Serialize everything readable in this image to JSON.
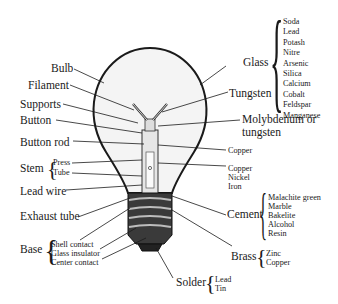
{
  "diagram": {
    "left_labels": {
      "bulb": "Bulb",
      "filament": "Filament",
      "supports": "Supports",
      "button": "Button",
      "button_rod": "Button rod",
      "stem": {
        "label": "Stem",
        "parts": [
          "Press",
          "Tube"
        ]
      },
      "lead_wire": "Lead wire",
      "exhaust_tube": "Exhaust tube",
      "base": {
        "label": "Base",
        "parts": [
          "Shell contact",
          "Glass insulator",
          "Center contact"
        ]
      }
    },
    "right_labels": {
      "glass": {
        "label": "Glass",
        "materials": [
          "Soda",
          "Lead",
          "Potash",
          "Nitre",
          "Arsenic",
          "Silica",
          "Calcium",
          "Cobalt",
          "Feldspar",
          "Manganese"
        ]
      },
      "tungsten": "Tungsten",
      "molybdenum": {
        "line1": "Molybdenum or",
        "line2": "tungsten"
      },
      "copper": "Copper",
      "lead_wire_materials": [
        "Copper",
        "Nickel",
        "Iron"
      ],
      "cement": {
        "label": "Cement",
        "materials": [
          "Malachite green",
          "Marble",
          "Bakelite",
          "Alcohol",
          "Resin"
        ]
      },
      "brass": {
        "label": "Brass",
        "materials": [
          "Zinc",
          "Copper"
        ]
      },
      "solder": {
        "label": "Solder",
        "materials": [
          "Lead",
          "Tin"
        ]
      }
    },
    "colors": {
      "ink": "#1a1a1a",
      "glass_fill": "#f4f4f4",
      "base_dark": "#2a2a2a"
    }
  }
}
